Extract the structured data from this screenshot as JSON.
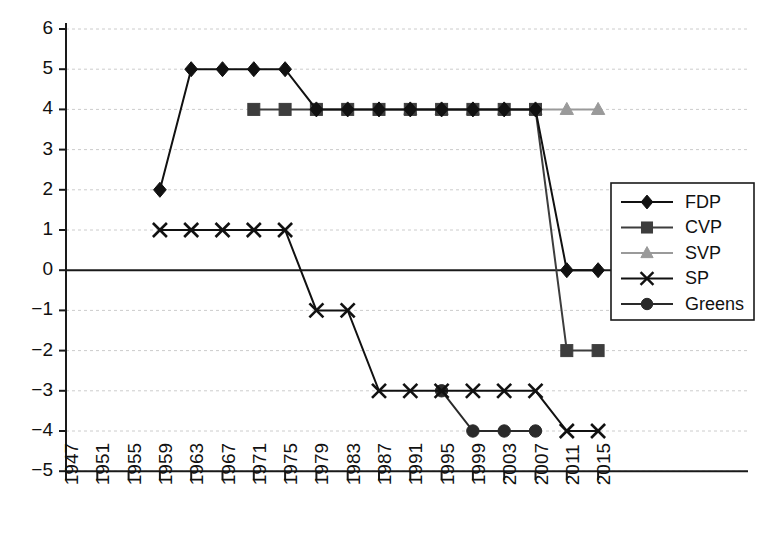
{
  "chart_data": {
    "type": "line",
    "title": "",
    "subtitle": "",
    "xlabel": "",
    "ylabel": "",
    "x": [
      1947,
      1951,
      1955,
      1959,
      1963,
      1967,
      1971,
      1975,
      1979,
      1983,
      1987,
      1991,
      1995,
      1999,
      2003,
      2007,
      2011,
      2015
    ],
    "xtick_labels": [
      "1947",
      "1951",
      "1955",
      "1959",
      "1963",
      "1967",
      "1971",
      "1975",
      "1979",
      "1983",
      "1987",
      "1991",
      "1995",
      "1999",
      "2003",
      "2007",
      "2011",
      "2015"
    ],
    "ytick_labels": [
      "6",
      "5",
      "4",
      "3",
      "2",
      "1",
      "0",
      "−1",
      "−2",
      "−3",
      "−4",
      "−5"
    ],
    "ytick_values": [
      6,
      5,
      4,
      3,
      2,
      1,
      0,
      -1,
      -2,
      -3,
      -4,
      -5
    ],
    "ylim": [
      -5,
      6
    ],
    "xlim": [
      1947,
      2015
    ],
    "grid": true,
    "grid_style": "dashed-horizontal",
    "zero_line": true,
    "legend_position": "right",
    "series": [
      {
        "name": "FDP",
        "marker": "diamond",
        "color": "#111111",
        "points": [
          {
            "x": 1959,
            "y": 2
          },
          {
            "x": 1963,
            "y": 5
          },
          {
            "x": 1967,
            "y": 5
          },
          {
            "x": 1971,
            "y": 5
          },
          {
            "x": 1975,
            "y": 5
          },
          {
            "x": 1979,
            "y": 4
          },
          {
            "x": 1983,
            "y": 4
          },
          {
            "x": 1987,
            "y": 4
          },
          {
            "x": 1991,
            "y": 4
          },
          {
            "x": 1995,
            "y": 4
          },
          {
            "x": 1999,
            "y": 4
          },
          {
            "x": 2003,
            "y": 4
          },
          {
            "x": 2007,
            "y": 4
          },
          {
            "x": 2011,
            "y": 0
          },
          {
            "x": 2015,
            "y": 0
          }
        ]
      },
      {
        "name": "CVP",
        "marker": "square",
        "color": "#3d3d3d",
        "points": [
          {
            "x": 1971,
            "y": 4
          },
          {
            "x": 1975,
            "y": 4
          },
          {
            "x": 1979,
            "y": 4
          },
          {
            "x": 1983,
            "y": 4
          },
          {
            "x": 1987,
            "y": 4
          },
          {
            "x": 1991,
            "y": 4
          },
          {
            "x": 1995,
            "y": 4
          },
          {
            "x": 1999,
            "y": 4
          },
          {
            "x": 2003,
            "y": 4
          },
          {
            "x": 2007,
            "y": 4
          },
          {
            "x": 2011,
            "y": -2
          },
          {
            "x": 2015,
            "y": -2
          }
        ]
      },
      {
        "name": "SVP",
        "marker": "triangle",
        "color": "#9a9a9a",
        "points": [
          {
            "x": 1991,
            "y": 4
          },
          {
            "x": 1995,
            "y": 4
          },
          {
            "x": 1999,
            "y": 4
          },
          {
            "x": 2003,
            "y": 4
          },
          {
            "x": 2007,
            "y": 4
          },
          {
            "x": 2011,
            "y": 4
          },
          {
            "x": 2015,
            "y": 4
          }
        ]
      },
      {
        "name": "SP",
        "marker": "x",
        "color": "#111111",
        "points": [
          {
            "x": 1959,
            "y": 1
          },
          {
            "x": 1963,
            "y": 1
          },
          {
            "x": 1967,
            "y": 1
          },
          {
            "x": 1971,
            "y": 1
          },
          {
            "x": 1975,
            "y": 1
          },
          {
            "x": 1979,
            "y": -1
          },
          {
            "x": 1983,
            "y": -1
          },
          {
            "x": 1987,
            "y": -3
          },
          {
            "x": 1991,
            "y": -3
          },
          {
            "x": 1995,
            "y": -3
          },
          {
            "x": 1999,
            "y": -3
          },
          {
            "x": 2003,
            "y": -3
          },
          {
            "x": 2007,
            "y": -3
          },
          {
            "x": 2011,
            "y": -4
          },
          {
            "x": 2015,
            "y": -4
          }
        ]
      },
      {
        "name": "Greens",
        "marker": "circle",
        "color": "#2a2a2a",
        "points": [
          {
            "x": 1995,
            "y": -3
          },
          {
            "x": 1999,
            "y": -4
          },
          {
            "x": 2003,
            "y": -4
          },
          {
            "x": 2007,
            "y": -4
          }
        ]
      }
    ],
    "legend": [
      {
        "label": "FDP",
        "marker": "diamond",
        "color": "#111111"
      },
      {
        "label": "CVP",
        "marker": "square",
        "color": "#3d3d3d"
      },
      {
        "label": "SVP",
        "marker": "triangle",
        "color": "#9a9a9a"
      },
      {
        "label": "SP",
        "marker": "x",
        "color": "#111111"
      },
      {
        "label": "Greens",
        "marker": "circle",
        "color": "#2a2a2a"
      }
    ]
  },
  "colors": {
    "axis": "#1a1a1a",
    "grid": "#cccccc",
    "zero_line": "#1a1a1a",
    "background": "#ffffff",
    "legend_border": "#1a1a1a"
  }
}
